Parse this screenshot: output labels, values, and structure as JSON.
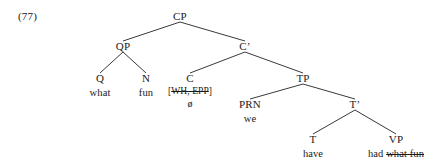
{
  "example": {
    "number": "(77)"
  },
  "tree": {
    "nodes": [
      {
        "id": "cp",
        "label": "CP",
        "x": 180,
        "y": 11,
        "word": null,
        "feature": null,
        "null_morph": null
      },
      {
        "id": "qp",
        "label": "QP",
        "x": 123,
        "y": 41,
        "word": null,
        "feature": null,
        "null_morph": null
      },
      {
        "id": "cbar",
        "label": "C’",
        "x": 245,
        "y": 41,
        "word": null,
        "feature": null,
        "null_morph": null
      },
      {
        "id": "q",
        "label": "Q",
        "x": 100,
        "y": 73,
        "word": "what",
        "feature": null,
        "null_morph": null
      },
      {
        "id": "n",
        "label": "N",
        "x": 146,
        "y": 73,
        "word": "fun",
        "feature": null,
        "null_morph": null
      },
      {
        "id": "c",
        "label": "C",
        "x": 190,
        "y": 73,
        "word": null,
        "feature": "[WH, EPP]",
        "null_morph": "ø"
      },
      {
        "id": "tp",
        "label": "TP",
        "x": 303,
        "y": 73,
        "word": null,
        "feature": null,
        "null_morph": null
      },
      {
        "id": "prn",
        "label": "PRN",
        "x": 250,
        "y": 99,
        "word": "we",
        "feature": null,
        "null_morph": null
      },
      {
        "id": "tbar",
        "label": "T’",
        "x": 355,
        "y": 99,
        "word": null,
        "feature": null,
        "null_morph": null
      },
      {
        "id": "t",
        "label": "T",
        "x": 313,
        "y": 134,
        "word": "have",
        "feature": null,
        "null_morph": null
      },
      {
        "id": "vp",
        "label": "VP",
        "x": 396,
        "y": 134,
        "word": "had what fun",
        "word_plain": "had ",
        "word_struck": "what fun",
        "feature": null,
        "null_morph": null
      }
    ],
    "edges": [
      {
        "from": "cp",
        "to": "qp",
        "x1": 180,
        "y1": 22,
        "x2": 123,
        "y2": 41
      },
      {
        "from": "cp",
        "to": "cbar",
        "x1": 180,
        "y1": 22,
        "x2": 245,
        "y2": 41
      },
      {
        "from": "qp",
        "to": "q",
        "x1": 123,
        "y1": 52,
        "x2": 100,
        "y2": 73
      },
      {
        "from": "qp",
        "to": "n",
        "x1": 123,
        "y1": 52,
        "x2": 146,
        "y2": 73
      },
      {
        "from": "cbar",
        "to": "c",
        "x1": 245,
        "y1": 52,
        "x2": 190,
        "y2": 73
      },
      {
        "from": "cbar",
        "to": "tp",
        "x1": 245,
        "y1": 52,
        "x2": 303,
        "y2": 73
      },
      {
        "from": "tp",
        "to": "prn",
        "x1": 303,
        "y1": 84,
        "x2": 250,
        "y2": 99
      },
      {
        "from": "tp",
        "to": "tbar",
        "x1": 303,
        "y1": 84,
        "x2": 355,
        "y2": 99
      },
      {
        "from": "tbar",
        "to": "t",
        "x1": 355,
        "y1": 110,
        "x2": 313,
        "y2": 134
      },
      {
        "from": "tbar",
        "to": "vp",
        "x1": 355,
        "y1": 110,
        "x2": 396,
        "y2": 134
      }
    ]
  },
  "style": {
    "line_color": "#3a3a3a",
    "text_color": "#1a1a1a",
    "background": "#ffffff"
  }
}
